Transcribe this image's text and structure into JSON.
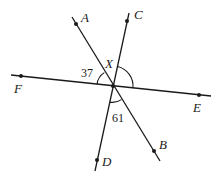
{
  "diagram": {
    "type": "geometry-intersecting-lines",
    "intersection": {
      "label": "X"
    },
    "lines": [
      {
        "name": "line-AB",
        "from": "A",
        "to": "B"
      },
      {
        "name": "line-CD",
        "from": "C",
        "to": "D"
      },
      {
        "name": "line-FE",
        "from": "F",
        "to": "E"
      }
    ],
    "points": {
      "A": {
        "label": "A"
      },
      "B": {
        "label": "B"
      },
      "C": {
        "label": "C"
      },
      "D": {
        "label": "D"
      },
      "E": {
        "label": "E"
      },
      "F": {
        "label": "F"
      }
    },
    "angles": {
      "AXF": {
        "value": "37",
        "between": [
          "XA",
          "XF"
        ]
      },
      "DXB": {
        "value": "61",
        "between": [
          "XD",
          "XB"
        ]
      },
      "CXE": {
        "value": "",
        "between": [
          "XC",
          "XE"
        ],
        "unknown": true
      }
    },
    "colors": {
      "ink": "#1a1a1a",
      "background": "#ffffff"
    }
  }
}
